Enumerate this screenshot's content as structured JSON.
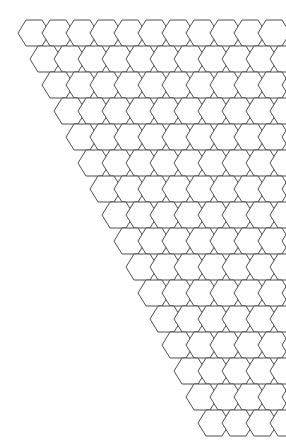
{
  "figure": {
    "kind": "hex-grid",
    "background_color": "#ffffff",
    "line_color": "#3a3a3a",
    "fill_color": "#ffffff",
    "line_width_px": 0.9,
    "canvas_width_px": 286,
    "canvas_height_px": 443
  },
  "chart_data": {
    "type": "diagram",
    "subtitle": "",
    "xlabel": "",
    "ylabel": "",
    "grid": true,
    "legend": [],
    "annotations": [],
    "hex_geometry": {
      "orientation": "flat-top",
      "hex_width_px": 32,
      "hex_height_px": 26,
      "column_spacing_px": 24,
      "row_spacing_px": 26,
      "row_shear_px": 12,
      "origin_x_px": 18,
      "origin_y_px": 20
    },
    "layout": {
      "shape": "sheared-parallelogram",
      "rows": 16,
      "columns_per_row": 11,
      "total_cells": 176,
      "description": "Each successive row is shifted right by half a column width, producing a rhombus-shaped honeycomb with a staircase edge on the upper-right and lower-left."
    },
    "row_definitions": [
      {
        "row": 0,
        "count": 11,
        "x_offset_px": 0
      },
      {
        "row": 1,
        "count": 11,
        "x_offset_px": 12
      },
      {
        "row": 2,
        "count": 11,
        "x_offset_px": 24
      },
      {
        "row": 3,
        "count": 11,
        "x_offset_px": 36
      },
      {
        "row": 4,
        "count": 11,
        "x_offset_px": 48
      },
      {
        "row": 5,
        "count": 11,
        "x_offset_px": 60
      },
      {
        "row": 6,
        "count": 11,
        "x_offset_px": 72
      },
      {
        "row": 7,
        "count": 11,
        "x_offset_px": 84
      },
      {
        "row": 8,
        "count": 11,
        "x_offset_px": 96
      },
      {
        "row": 9,
        "count": 11,
        "x_offset_px": 108
      },
      {
        "row": 10,
        "count": 11,
        "x_offset_px": 120
      },
      {
        "row": 11,
        "count": 11,
        "x_offset_px": 132
      },
      {
        "row": 12,
        "count": 11,
        "x_offset_px": 144
      },
      {
        "row": 13,
        "count": 11,
        "x_offset_px": 156
      },
      {
        "row": 14,
        "count": 11,
        "x_offset_px": 168
      },
      {
        "row": 15,
        "count": 11,
        "x_offset_px": 180
      }
    ]
  }
}
